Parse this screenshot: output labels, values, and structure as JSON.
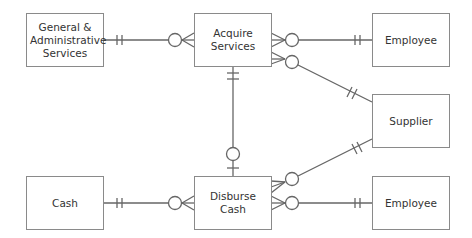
{
  "diagram": {
    "type": "entity-relationship",
    "entities": [
      {
        "id": "ga",
        "label": "General &\nAdministrative\nServices",
        "x": 26,
        "y": 13,
        "w": 77,
        "h": 53
      },
      {
        "id": "acquire",
        "label": "Acquire\nServices",
        "x": 194,
        "y": 13,
        "w": 77,
        "h": 53
      },
      {
        "id": "employee1",
        "label": "Employee",
        "x": 372,
        "y": 13,
        "w": 77,
        "h": 53
      },
      {
        "id": "supplier",
        "label": "Supplier",
        "x": 372,
        "y": 94,
        "w": 77,
        "h": 53
      },
      {
        "id": "cash",
        "label": "Cash",
        "x": 26,
        "y": 176,
        "w": 77,
        "h": 53
      },
      {
        "id": "disburse",
        "label": "Disburse\nCash",
        "x": 194,
        "y": 176,
        "w": 77,
        "h": 53
      },
      {
        "id": "employee2",
        "label": "Employee",
        "x": 372,
        "y": 176,
        "w": 77,
        "h": 53
      }
    ],
    "relationships": [
      {
        "from": "ga",
        "to": "acquire",
        "from_cardinality": "one-and-only-one",
        "to_cardinality": "zero-or-many"
      },
      {
        "from": "employee1",
        "to": "acquire",
        "from_cardinality": "one-and-only-one",
        "to_cardinality": "zero-or-many"
      },
      {
        "from": "supplier",
        "to": "acquire",
        "from_cardinality": "one-and-only-one",
        "to_cardinality": "zero-or-many"
      },
      {
        "from": "acquire",
        "to": "disburse",
        "from_cardinality": "one-and-only-one",
        "to_cardinality": "zero-or-one"
      },
      {
        "from": "cash",
        "to": "disburse",
        "from_cardinality": "one-and-only-one",
        "to_cardinality": "zero-or-many"
      },
      {
        "from": "supplier",
        "to": "disburse",
        "from_cardinality": "one-and-only-one",
        "to_cardinality": "zero-or-many"
      },
      {
        "from": "employee2",
        "to": "disburse",
        "from_cardinality": "one-and-only-one",
        "to_cardinality": "zero-or-many"
      }
    ]
  },
  "labels": {
    "ga": "General & Administrative Services",
    "acquire": "Acquire Services",
    "employee1": "Employee",
    "supplier": "Supplier",
    "cash": "Cash",
    "disburse": "Disburse Cash",
    "employee2": "Employee"
  }
}
